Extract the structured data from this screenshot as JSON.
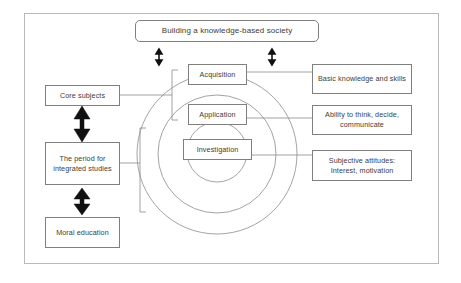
{
  "diagram": {
    "title_box": {
      "label": "Building a knowledge-based society"
    },
    "left_column": {
      "items": [
        {
          "id": "core-subjects",
          "label": "Core subjects"
        },
        {
          "id": "integrated-studies",
          "label": "The period for integrated studies"
        },
        {
          "id": "moral-education",
          "label": "Moral education"
        }
      ]
    },
    "center_column": {
      "items": [
        {
          "id": "acquisition",
          "label": "Acquisition"
        },
        {
          "id": "application",
          "label": "Application"
        },
        {
          "id": "investigation",
          "label": "Investigation"
        }
      ]
    },
    "right_column": {
      "items": [
        {
          "id": "basic-knowledge",
          "label": "Basic knowledge and skills"
        },
        {
          "id": "ability-think",
          "label": "Ability to think, decide, communicate"
        },
        {
          "id": "subjective-attitudes",
          "label": "Subjective attitudes: Interest, motivation"
        }
      ]
    },
    "colors": {
      "frame_border": "#b9b9b9",
      "box_border": "#7f7f7f",
      "circle_stroke": "#8c8c8c",
      "connector_stroke": "#8c8c8c",
      "arrow_fill": "#111111",
      "text": "#3b3b3b",
      "background": "#ffffff"
    }
  }
}
